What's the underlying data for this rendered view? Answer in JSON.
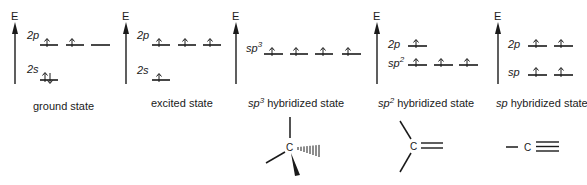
{
  "figure": {
    "axis_label": "E",
    "panels": [
      {
        "id": "ground",
        "caption": "ground state",
        "caption_prefix": "",
        "caption_sup": "",
        "levels": [
          {
            "label": "2p",
            "sup": "",
            "electrons": [
              "up",
              "up",
              "empty"
            ]
          },
          {
            "label": "2s",
            "sup": "",
            "electrons": [
              "updown"
            ]
          }
        ]
      },
      {
        "id": "excited",
        "caption": "excited state",
        "caption_prefix": "",
        "caption_sup": "",
        "levels": [
          {
            "label": "2p",
            "sup": "",
            "electrons": [
              "up",
              "up",
              "up"
            ]
          },
          {
            "label": "2s",
            "sup": "",
            "electrons": [
              "up"
            ]
          }
        ]
      },
      {
        "id": "sp3",
        "caption": " hybridized state",
        "caption_prefix": "sp",
        "caption_sup": "3",
        "levels": [
          {
            "label": "sp",
            "sup": "3",
            "electrons": [
              "up",
              "up",
              "up",
              "up"
            ]
          }
        ],
        "structure": "tetrahedral carbon (C) with one wedge and one hashed bond"
      },
      {
        "id": "sp2",
        "caption": " hybridized state",
        "caption_prefix": "sp",
        "caption_sup": "2",
        "levels": [
          {
            "label": "2p",
            "sup": "",
            "electrons": [
              "up"
            ]
          },
          {
            "label": "sp",
            "sup": "2",
            "electrons": [
              "up",
              "up",
              "up"
            ]
          }
        ],
        "structure": "trigonal planar carbon (C) with a double bond"
      },
      {
        "id": "sp",
        "caption": " hybridized state",
        "caption_prefix": "sp",
        "caption_sup": "",
        "levels": [
          {
            "label": "2p",
            "sup": "",
            "electrons": [
              "up",
              "up"
            ]
          },
          {
            "label": "sp",
            "sup": "",
            "electrons": [
              "up",
              "up"
            ]
          }
        ],
        "structure": "linear carbon (C) with a triple bond"
      }
    ],
    "atom_label": "C"
  }
}
